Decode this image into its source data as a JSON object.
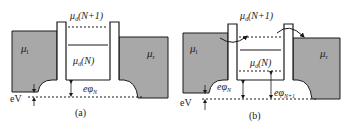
{
  "colors": {
    "lead_fill": "#a8a8a8",
    "line": "#1a1a1a",
    "background": "#ffffff"
  },
  "panels": [
    {
      "id": "a",
      "caption": "(a)",
      "labels": {
        "mu_left": "μ",
        "mu_left_sub": "l",
        "mu_right": "μ",
        "mu_right_sub": "r",
        "mu_d_top": "μ",
        "mu_d_top_sub": "d",
        "mu_d_top_arg": "(N+1)",
        "mu_d_mid": "μ",
        "mu_d_mid_sub": "d",
        "mu_d_mid_arg": "(N)",
        "e_phi_N": "eφ",
        "e_phi_N_sub": "N",
        "bias": "eV"
      }
    },
    {
      "id": "b",
      "caption": "(b)",
      "labels": {
        "mu_left": "μ",
        "mu_left_sub": "l",
        "mu_right": "μ",
        "mu_right_sub": "r",
        "mu_d_top": "μ",
        "mu_d_top_sub": "d",
        "mu_d_top_arg": "(N+1)",
        "mu_d_mid": "μ",
        "mu_d_mid_sub": "d",
        "mu_d_mid_arg": "(N)",
        "e_phi_N": "eφ",
        "e_phi_N_sub": "N",
        "e_phi_N1": "eφ",
        "e_phi_N1_sub": "N+1",
        "bias": "eV"
      }
    }
  ]
}
